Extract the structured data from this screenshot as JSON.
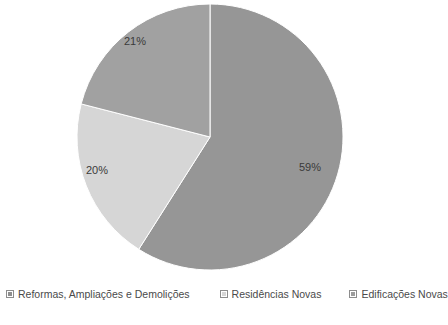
{
  "chart_data": {
    "type": "pie",
    "title": "",
    "labels": [
      "Reformas, Ampliações e Demolições",
      "Residências Novas",
      "Edificações Novas"
    ],
    "values": [
      59,
      20,
      21
    ],
    "value_labels": [
      "59%",
      "20%",
      "21%"
    ],
    "unit": "%",
    "colors": [
      "#969696",
      "#d6d6d6",
      "#a1a1a1"
    ],
    "start_angle_deg": 0,
    "direction": "clockwise",
    "legend_position": "bottom",
    "grid": false
  },
  "legend": {
    "items": [
      {
        "label": "Reformas, Ampliações e Demolições",
        "color": "#8f8f8f",
        "swatch": "legend-swatch-icon"
      },
      {
        "label": "Residências Novas",
        "color": "#d6d6d6",
        "swatch": "legend-swatch-icon"
      },
      {
        "label": "Edificações Novas",
        "color": "#9c9c9c",
        "swatch": "legend-swatch-icon"
      }
    ]
  }
}
